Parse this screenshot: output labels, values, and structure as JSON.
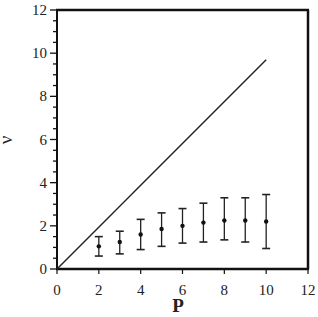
{
  "chart_data": {
    "type": "scatter",
    "title": "",
    "xlabel": "P",
    "ylabel": "ν",
    "xlim": [
      0,
      12
    ],
    "ylim": [
      0,
      12
    ],
    "x_ticks": [
      0,
      2,
      4,
      6,
      8,
      10,
      12
    ],
    "y_ticks": [
      0,
      2,
      4,
      6,
      8,
      10,
      12
    ],
    "y_minor_tick_step": 0.5,
    "grid": false,
    "legend": null,
    "series": [
      {
        "name": "reference line",
        "kind": "line",
        "x": [
          0,
          10
        ],
        "y": [
          0,
          9.7
        ]
      },
      {
        "name": "measured",
        "kind": "errorbar",
        "x": [
          2,
          3,
          4,
          5,
          6,
          7,
          8,
          9,
          10
        ],
        "y": [
          1.05,
          1.25,
          1.6,
          1.85,
          2.0,
          2.15,
          2.25,
          2.25,
          2.2
        ],
        "y_upper": [
          1.5,
          1.75,
          2.3,
          2.6,
          2.8,
          3.05,
          3.3,
          3.3,
          3.45
        ],
        "y_lower": [
          0.6,
          0.7,
          0.9,
          1.05,
          1.2,
          1.25,
          1.35,
          1.25,
          0.95
        ]
      }
    ]
  },
  "labels": {
    "x_axis": "P",
    "y_axis": "ν",
    "x_ticks": [
      "0",
      "2",
      "4",
      "6",
      "8",
      "10",
      "12"
    ],
    "y_ticks": [
      "0",
      "2",
      "4",
      "6",
      "8",
      "10",
      "12"
    ]
  }
}
